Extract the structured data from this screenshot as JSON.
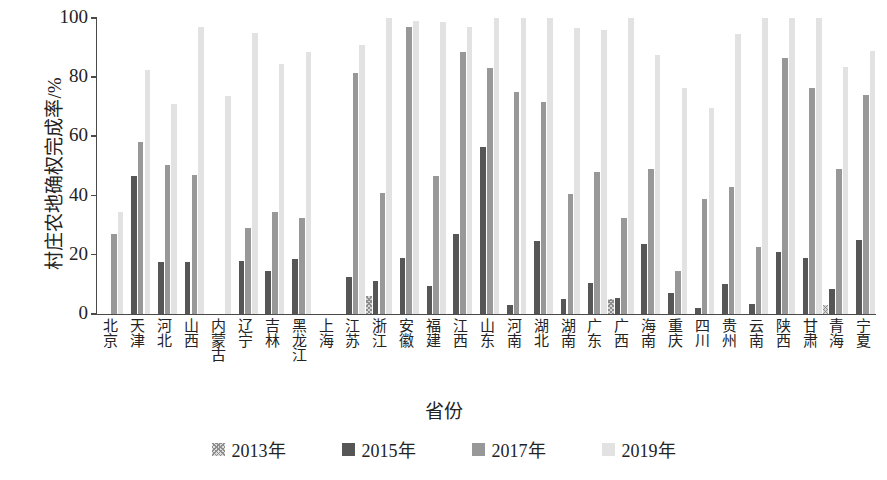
{
  "chart_data": {
    "type": "bar",
    "title": "",
    "xlabel": "省份",
    "ylabel": "村庄农地确权完成率/%",
    "ylim": [
      0,
      100
    ],
    "yticks": [
      0,
      20,
      40,
      60,
      80,
      100
    ],
    "grid": false,
    "legend_position": "bottom",
    "categories": [
      "北京",
      "天津",
      "河北",
      "山西",
      "内蒙古",
      "辽宁",
      "吉林",
      "黑龙江",
      "上海",
      "江苏",
      "浙江",
      "安徽",
      "福建",
      "江西",
      "山东",
      "河南",
      "湖北",
      "湖南",
      "广东",
      "广西",
      "海南",
      "重庆",
      "四川",
      "贵州",
      "云南",
      "陕西",
      "甘肃",
      "青海",
      "宁夏"
    ],
    "series": [
      {
        "name": "2013年",
        "color": "#d6d6d6",
        "values": [
          0,
          0,
          0,
          0,
          0,
          0,
          0,
          0,
          0,
          0,
          6,
          0,
          0,
          0,
          0,
          0,
          0,
          0,
          0,
          5,
          0,
          0,
          0,
          0,
          0,
          0,
          0,
          3,
          0
        ]
      },
      {
        "name": "2015年",
        "color": "#565656",
        "values": [
          0,
          46.5,
          17.5,
          17.5,
          0,
          18,
          14.5,
          18.5,
          0,
          12.5,
          11,
          19,
          9.5,
          27,
          56.5,
          3,
          24.5,
          5,
          10.5,
          5.5,
          23.5,
          7,
          2,
          10,
          3.5,
          21,
          19,
          8.5,
          25
        ]
      },
      {
        "name": "2017年",
        "color": "#989898",
        "values": [
          27,
          58,
          50.5,
          47,
          0,
          29,
          34.5,
          32.5,
          0,
          81.5,
          41,
          97,
          46.5,
          88.5,
          83,
          75,
          71.5,
          40.5,
          48,
          32.5,
          49,
          14.5,
          39,
          43,
          22.5,
          86.5,
          76.5,
          49,
          74
        ]
      },
      {
        "name": "2019年",
        "color": "#e2e2e2",
        "values": [
          34.5,
          82.5,
          71,
          97,
          73.5,
          95,
          84.5,
          88.5,
          0,
          91,
          100,
          99,
          98.5,
          97,
          100,
          100,
          100,
          96.5,
          96,
          100,
          87.5,
          76.5,
          69.5,
          94.5,
          100,
          100,
          100,
          83.5,
          89
        ]
      }
    ]
  }
}
